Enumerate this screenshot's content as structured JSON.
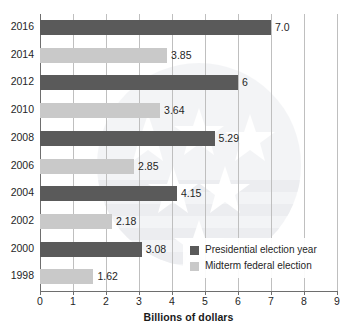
{
  "chart_data": {
    "type": "bar",
    "orientation": "horizontal",
    "title": "",
    "xlabel": "Billions of dollars",
    "ylabel": "",
    "xlim": [
      0,
      9
    ],
    "xticks": [
      0,
      1,
      2,
      3,
      4,
      5,
      6,
      7,
      8,
      9
    ],
    "xtick_labels": [
      "0",
      "1",
      "2",
      "3",
      "4",
      "5",
      "6",
      "7",
      "8",
      "9"
    ],
    "grid": true,
    "grid_axis": "x",
    "legend_position": "bottom-right",
    "categories": [
      "2016",
      "2014",
      "2012",
      "2010",
      "2008",
      "2006",
      "2004",
      "2002",
      "2000",
      "1998"
    ],
    "values": [
      7.0,
      3.85,
      6,
      3.64,
      5.29,
      2.85,
      4.15,
      2.18,
      3.08,
      1.62
    ],
    "value_labels": [
      "7.0",
      "3.85",
      "6",
      "3.64",
      "5.29",
      "2.85",
      "4.15",
      "2.18",
      "3.08",
      "1.62"
    ],
    "bar_series": [
      "presidential",
      "midterm",
      "presidential",
      "midterm",
      "presidential",
      "midterm",
      "presidential",
      "midterm",
      "presidential",
      "midterm"
    ],
    "series": [
      {
        "name": "Presidential election year",
        "key": "presidential",
        "color": "#5a5a5a",
        "points": [
          {
            "category": "2016",
            "value": 7.0,
            "label": "7.0"
          },
          {
            "category": "2012",
            "value": 6,
            "label": "6"
          },
          {
            "category": "2008",
            "value": 5.29,
            "label": "5.29"
          },
          {
            "category": "2004",
            "value": 4.15,
            "label": "4.15"
          },
          {
            "category": "2000",
            "value": 3.08,
            "label": "3.08"
          }
        ]
      },
      {
        "name": "Midterm federal election",
        "key": "midterm",
        "color": "#c9c9c9",
        "points": [
          {
            "category": "2014",
            "value": 3.85,
            "label": "3.85"
          },
          {
            "category": "2010",
            "value": 3.64,
            "label": "3.64"
          },
          {
            "category": "2006",
            "value": 2.85,
            "label": "2.85"
          },
          {
            "category": "2002",
            "value": 2.18,
            "label": "2.18"
          },
          {
            "category": "1998",
            "value": 1.62,
            "label": "1.62"
          }
        ]
      }
    ],
    "bars": [
      {
        "category": "2016",
        "value": 7.0,
        "label": "7.0",
        "series": "presidential"
      },
      {
        "category": "2014",
        "value": 3.85,
        "label": "3.85",
        "series": "midterm"
      },
      {
        "category": "2012",
        "value": 6,
        "label": "6",
        "series": "presidential"
      },
      {
        "category": "2010",
        "value": 3.64,
        "label": "3.64",
        "series": "midterm"
      },
      {
        "category": "2008",
        "value": 5.29,
        "label": "5.29",
        "series": "presidential"
      },
      {
        "category": "2006",
        "value": 2.85,
        "label": "2.85",
        "series": "midterm"
      },
      {
        "category": "2004",
        "value": 4.15,
        "label": "4.15",
        "series": "presidential"
      },
      {
        "category": "2002",
        "value": 2.18,
        "label": "2.18",
        "series": "midterm"
      },
      {
        "category": "2000",
        "value": 3.08,
        "label": "3.08",
        "series": "presidential"
      },
      {
        "category": "1998",
        "value": 1.62,
        "label": "1.62",
        "series": "midterm"
      }
    ],
    "legend": [
      {
        "label": "Presidential election year",
        "color": "#5a5a5a"
      },
      {
        "label": "Midterm federal election",
        "color": "#c9c9c9"
      }
    ]
  },
  "colors": {
    "presidential": "#5a5a5a",
    "midterm": "#c9c9c9",
    "axis": "#6e6e6e",
    "gridline": "#bfbfbf",
    "text": "#1f1f1f",
    "background": "#ffffff"
  },
  "watermark": {
    "name": "vote-flag-star-watermark"
  }
}
